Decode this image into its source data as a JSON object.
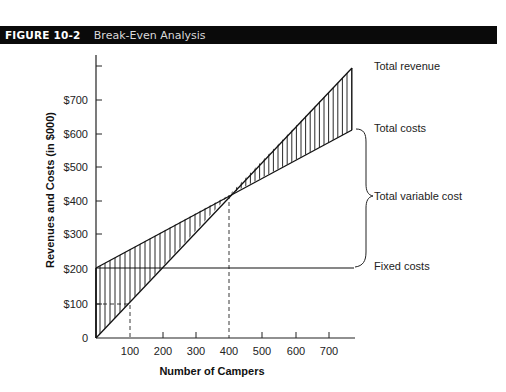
{
  "header": {
    "figure_number": "FIGURE 10-2",
    "title": "Break-Even Analysis"
  },
  "chart_data": {
    "type": "line",
    "title": "Break-Even Analysis",
    "xlabel": "Number of Campers",
    "ylabel": "Revenues and Costs (in $000)",
    "x_ticks": [
      "100",
      "200",
      "300",
      "400",
      "500",
      "600",
      "700"
    ],
    "y_ticks": [
      "0",
      "$100",
      "$200",
      "$300",
      "$400",
      "$500",
      "$600",
      "$700"
    ],
    "xlim": [
      0,
      770
    ],
    "ylim": [
      0,
      800
    ],
    "grid": false,
    "x": [
      0,
      770
    ],
    "series": [
      {
        "name": "Total revenue",
        "values": [
          0,
          790
        ]
      },
      {
        "name": "Total costs",
        "values": [
          200,
          610
        ]
      },
      {
        "name": "Fixed costs",
        "values": [
          200,
          200
        ]
      }
    ],
    "break_even": {
      "campers": 400,
      "amount": 400
    },
    "reference_point": {
      "campers": 100,
      "amount": 100
    },
    "annotations": {
      "total_revenue": "Total revenue",
      "total_costs": "Total costs",
      "total_variable_cost": "Total variable cost",
      "fixed_costs": "Fixed costs"
    },
    "shading": "vertical hatching between revenue and total-cost lines (loss area left of break-even, profit area right)"
  }
}
